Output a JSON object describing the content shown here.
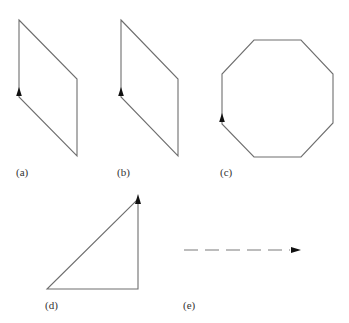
{
  "figure": {
    "panels": [
      {
        "id": "a",
        "label": "(a)",
        "shape": "parallelogram",
        "vertices": [
          [
            19,
            20
          ],
          [
            77,
            79
          ],
          [
            77,
            156
          ],
          [
            19,
            97
          ]
        ],
        "arrow": {
          "position": [
            19,
            94
          ],
          "direction": "up"
        }
      },
      {
        "id": "b",
        "label": "(b)",
        "shape": "parallelogram",
        "vertices": [
          [
            121,
            20
          ],
          [
            178,
            79
          ],
          [
            178,
            156
          ],
          [
            121,
            97
          ]
        ],
        "arrow": {
          "position": [
            121,
            94
          ],
          "direction": "up"
        }
      },
      {
        "id": "c",
        "label": "(c)",
        "shape": "octagon",
        "vertices": [
          [
            254,
            40
          ],
          [
            301,
            40
          ],
          [
            333,
            74
          ],
          [
            333,
            123
          ],
          [
            301,
            157
          ],
          [
            254,
            157
          ],
          [
            222,
            124
          ],
          [
            222,
            74
          ]
        ],
        "arrow": {
          "position": [
            222,
            120
          ],
          "direction": "up"
        }
      },
      {
        "id": "d",
        "label": "(d)",
        "shape": "right-triangle",
        "vertices": [
          [
            47,
            289
          ],
          [
            138,
            289
          ],
          [
            138,
            196
          ]
        ],
        "arrow": {
          "position": [
            138,
            196
          ],
          "direction": "up"
        }
      },
      {
        "id": "e",
        "label": "(e)",
        "shape": "dashed-arrow",
        "start": [
          184,
          250
        ],
        "end": [
          301,
          250
        ],
        "arrow": {
          "position": [
            301,
            250
          ],
          "direction": "right"
        }
      }
    ],
    "colors": {
      "stroke": "#6e6e6e",
      "arrowhead": "#111111",
      "label": "#333333",
      "background": "#ffffff"
    }
  }
}
